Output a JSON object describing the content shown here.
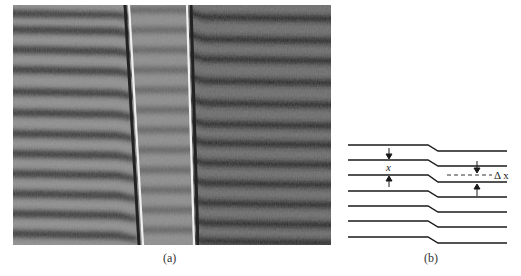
{
  "figure": {
    "panel_a": {
      "caption": "(a)",
      "description": "interference fringe photograph",
      "colors": {
        "background": "#6e6e6e",
        "dark_fringe": "#2a2a2a",
        "light_fringe": "#9a9a9a",
        "center_band": "#8a8a8a",
        "bright_line": "#e8e8e8"
      }
    },
    "panel_b": {
      "caption": "(b)",
      "label_x": "x",
      "label_delta_x": "Δ x",
      "line_count": 7,
      "colors": {
        "line": "#1a1a1a"
      }
    }
  }
}
